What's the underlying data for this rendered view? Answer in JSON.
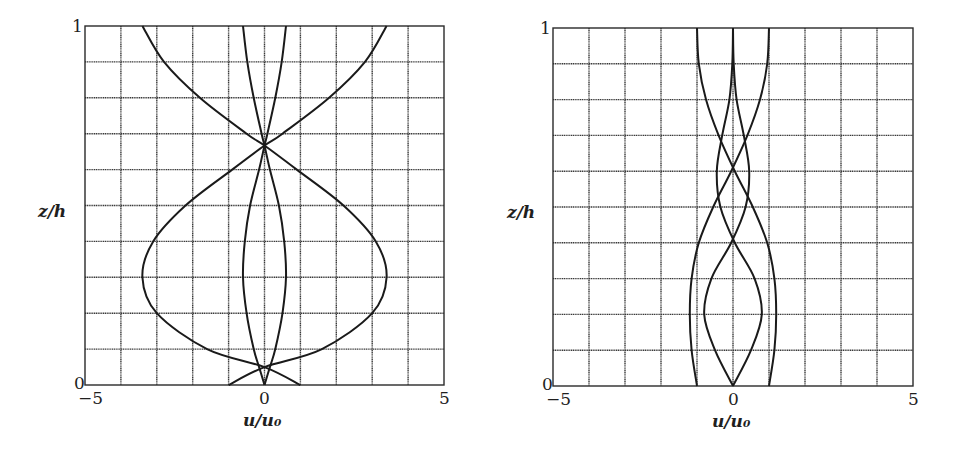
{
  "chart_data": [
    {
      "type": "line",
      "panel": "left",
      "title": "",
      "xlabel": "u/u0",
      "ylabel": "z/h",
      "xlim": [
        -5,
        5
      ],
      "ylim": [
        0,
        1
      ],
      "x_ticks": [
        "-5",
        "0",
        "5"
      ],
      "y_ticks": [
        "0",
        "1"
      ],
      "grid": true,
      "grid_x_step": 1,
      "grid_y_step": 0.1,
      "z": [
        0,
        0.05,
        0.1,
        0.2,
        0.3,
        0.4,
        0.5,
        0.6,
        0.667,
        0.7,
        0.8,
        0.9,
        1.0
      ],
      "series": [
        {
          "name": "outer-a",
          "values": [
            -1.0,
            0.0,
            1.6,
            3.0,
            3.4,
            3.1,
            2.2,
            0.9,
            0.0,
            -0.5,
            -1.8,
            -2.8,
            -3.4
          ]
        },
        {
          "name": "outer-b",
          "values": [
            1.0,
            0.0,
            -1.6,
            -3.0,
            -3.4,
            -3.1,
            -2.2,
            -0.9,
            0.0,
            0.5,
            1.8,
            2.8,
            3.4
          ]
        },
        {
          "name": "inner-a",
          "values": [
            0.0,
            0.15,
            0.3,
            0.5,
            0.6,
            0.55,
            0.4,
            0.15,
            0.0,
            -0.08,
            -0.3,
            -0.48,
            -0.6
          ]
        },
        {
          "name": "inner-b",
          "values": [
            0.0,
            -0.15,
            -0.3,
            -0.5,
            -0.6,
            -0.55,
            -0.4,
            -0.15,
            0.0,
            0.08,
            0.3,
            0.48,
            0.6
          ]
        }
      ]
    },
    {
      "type": "line",
      "panel": "right",
      "title": "",
      "xlabel": "u/u0",
      "ylabel": "z/h",
      "xlim": [
        -5,
        5
      ],
      "ylim": [
        0,
        1
      ],
      "x_ticks": [
        "-5",
        "0",
        "5"
      ],
      "y_ticks": [
        "0",
        "1"
      ],
      "grid": true,
      "grid_x_step": 1,
      "grid_y_step": 0.1,
      "z": [
        0,
        0.1,
        0.2,
        0.3,
        0.4,
        0.5,
        0.6,
        0.7,
        0.8,
        0.9,
        1.0
      ],
      "series": [
        {
          "name": "a",
          "values": [
            -1.0,
            -1.15,
            -1.2,
            -1.15,
            -0.95,
            -0.55,
            -0.05,
            0.4,
            0.75,
            0.95,
            1.0
          ]
        },
        {
          "name": "b",
          "values": [
            1.0,
            1.15,
            1.2,
            1.15,
            0.95,
            0.55,
            0.05,
            -0.4,
            -0.75,
            -0.95,
            -1.0
          ]
        },
        {
          "name": "c",
          "values": [
            0.0,
            -0.5,
            -0.8,
            -0.6,
            -0.05,
            0.35,
            0.45,
            0.3,
            0.1,
            0.02,
            0.0
          ]
        },
        {
          "name": "d",
          "values": [
            0.0,
            0.5,
            0.8,
            0.6,
            0.05,
            -0.35,
            -0.45,
            -0.3,
            -0.1,
            -0.02,
            0.0
          ]
        }
      ]
    }
  ],
  "panels": {
    "left": {
      "xlabel": "u/u₀",
      "ylabel": "z/h",
      "y_top": "1",
      "y_bottom": "0",
      "x_left": "−5",
      "x_mid": "0",
      "x_right": "5"
    },
    "right": {
      "xlabel": "u/u₀",
      "ylabel": "z/h",
      "y_top": "1",
      "y_bottom": "0",
      "x_left": "−5",
      "x_mid": "0",
      "x_right": "5"
    }
  }
}
